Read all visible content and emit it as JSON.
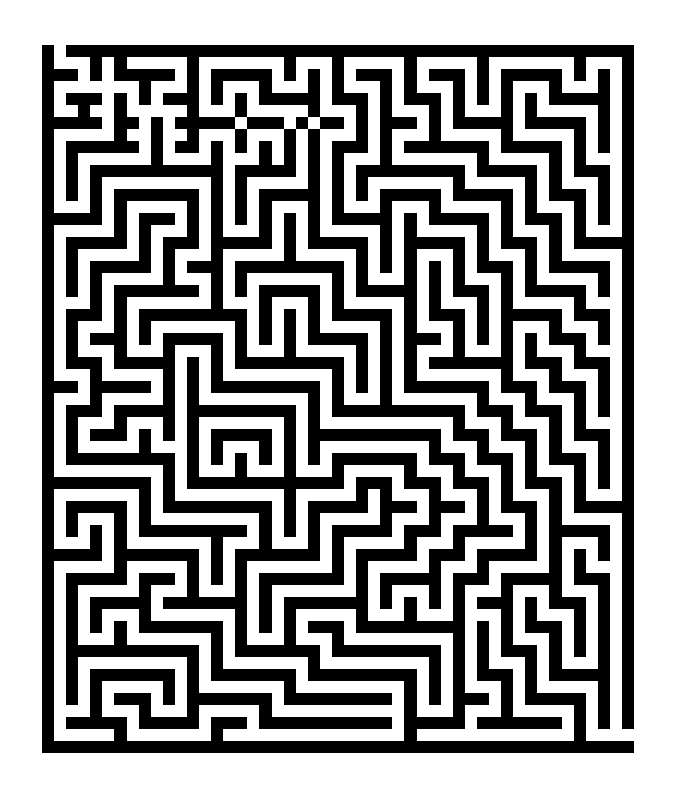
{
  "maze": {
    "cols": 49,
    "rows": 59,
    "wall_color": "#000000",
    "path_color": "#ffffff",
    "entrance": {
      "row": 0,
      "col": 1
    },
    "exit": {
      "row": 57,
      "col": 48
    },
    "grid": [
      "#.###############################################",
      "#...#.#.....#.......#...#.....#.....#.......#...#",
      "###.#.#####.#.#####.#.#.#.###.#.###.#.#####.#.#.#",
      "#.......#...#.#...#...#.#...#.#...#.#.#...#...#.#",
      "#.###.#.#.###.#.#.#####.###.#.###.#.#.#.#.#####.#",
      "#..#..#.....#...#.....#...#.#...#.#...#.#.....#.#",
      "#####.##.#.#####.###.#.##.#.###.#.#####.#####.#.#",
      "#.....#..#..#...#...#.#...#.#...#.....#.....#.#.#",
      "#.######.#.##.#.#.#.#.#.###.#.#######.#####.#.#.#",
      "#.#......#....#...#.#.#.#...#.......#.....#.#...#",
      "#.#.###########.#####.#.#.#########.#####.#.###.#",
      "#.#.#.........#.#.....#.#.#.......#.....#.#...#.#",
      "#.#.#.#######.#.#.#####.#.#.#####.#####.#.###.#.#",
      "#...#.#.....#.#.#.#...#.#...#...#.....#.#...#.#.#",
      "#####.#.###.#.#.#.#.#.#.#####.#.#####.#.###.#.#.#",
      "#.....#.#...#.#...#.#.#.....#.#.....#.#...#.#...#",
      "#.#####.#.###.#####.#.#####.#.#####.#.###.#.#####",
      "#.#.....#.#...#.....#.....#.#.#...#.#...#.#.....#",
      "#.#.#####.#.###.#########.#.#.#.#.#.###.#.#####.#",
      "#.#.#.....#...#.#.......#.#...#.#.#...#.#.....#.#",
      "#.#.#.#######.#.#.#####.#.#####.#.###.#.#####.#.#",
      "#...#.#.......#...#...#.#.....#.#...#.#.....#...#",
      "#.###.#.#########.#.#.#.#####.#.###.#.#####.###.#",
      "#.#...#.#.......#.#.#.#.....#.#...#.#.#...#...#.#",
      "#.#.###.#.#####.#.#.#.#####.#.###.#.#.#.#.###.#.#",
      "#.#...#...#...#.#...#.....#.#.#...#...#.#...#...#",
      "#.###.#####.#.#.#########.#.#.#.#######.###.###.#",
      "#...#.....#.#.#.........#.#.#.#.......#...#...#.#",
      "###.#####.#.#.#########.#.#.#.#######.###.###.#.#",
      "#...#.....#.#.........#.#...#.......#...#...#.#.#",
      "#.###.#####.#########.#.###########.###.###.#.#.#",
      "#.#...#...#.#.......#.#...........#...#...#.#...#",
      "#.#.###.#.#.#.#####.#.###########.###.###.#.###.#",
      "#.#.....#...#.#...#.#.#.........#...#...#.#...#.#",
      "#.#########.#.#.#.#.#.#.#######.###.###.#.###.#.#",
      "#.........#.#...#...#...#.....#...#...#.#...#.#.#",
      "#########.#.#############.###.###.###.#.###.#.#.#",
      "#.......#.#.........#.....#.#...#...#.#...#.#...#",
      "#.#####.#.#########.#.#####.###.###.#.###.#.#####",
      "#.#...#.#.........#.#.#.....#...#...#...#.#.....#",
      "#.#.#.#.#########.#.#.#.#####.###.#####.#.#####.#",
      "#...#.#.......#...#...#.#.....#...#.....#.#...#.#",
      "#####.#######.#.#######.#.#####.###.#####.#.#.#.#",
      "#.....#.....#.#.#.......#.#.....#...#.....#.#...#",
      "#.#####.###.#.#.#.#######.#.#####.###.#####.###.#",
      "#.#.....#...#...#.#.......#.#...#.#...#...#...#.#",
      "#.#.#####.#######.#.#######.#.#.#.#.###.#.###.#.#",
      "#.#.#...#.......#.#.#.....#...#...#...#.#...#.#.#",
      "#.#.#.#.#######.#.#.#.###.#########.#.#.###.#.#.#",
      "#.#...#.......#.#...#...#.........#.#.#...#.#.#.#",
      "#.###########.#.#######.#########.#.#.###.#.#.#.#",
      "#.#.........#.#.......#.........#.#.#...#.#...#.#",
      "#.#.#######.#.#######.#########.#.#.###.#.#####.#",
      "#.#.#.....#.#.......#.........#.#.#...#.#.....#.#",
      "#.#.#.###.#.#######.#########.#.#.###.#.#####.#.#",
      "#...#...#...#.....#...........#...#...#.....#.#.#",
      "#.#####.#####.###.###########.#####.#######.#.#.#",
      "#.....#.......#...............#.............#....",
      "#################################################"
    ]
  }
}
